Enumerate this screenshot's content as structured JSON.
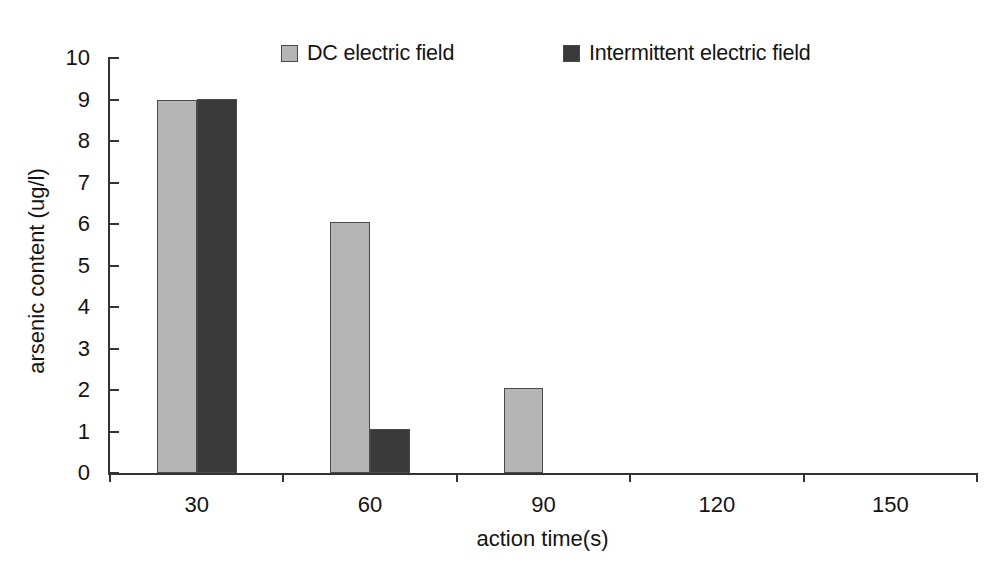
{
  "chart_data": {
    "type": "bar",
    "title": "",
    "xlabel": "action time(s)",
    "ylabel": "arsenic content (ug/l)",
    "categories": [
      "30",
      "60",
      "90",
      "120",
      "150"
    ],
    "series": [
      {
        "name": "DC electric field",
        "color": "#b5b5b5",
        "values": [
          9.0,
          6.05,
          2.05,
          0,
          0
        ]
      },
      {
        "name": "Intermittent electric field",
        "color": "#3a3a3a",
        "values": [
          9.02,
          1.05,
          0,
          0,
          0
        ]
      }
    ],
    "ylim": [
      0,
      10
    ],
    "yticks": [
      "0",
      "1",
      "2",
      "3",
      "4",
      "5",
      "6",
      "7",
      "8",
      "9",
      "10"
    ],
    "grid": false,
    "legend_position": "top"
  },
  "legend": {
    "entries": [
      {
        "label": "DC electric field",
        "swatch_color": "#b5b5b5"
      },
      {
        "label": "Intermittent electric field",
        "swatch_color": "#3a3a3a"
      }
    ]
  },
  "axes": {
    "y_title": "arsenic content (ug/l)",
    "x_title": "action time(s)",
    "y_tick_labels": [
      "10",
      "9",
      "8",
      "7",
      "6",
      "5",
      "4",
      "3",
      "2",
      "1",
      "0"
    ],
    "x_tick_labels": [
      "30",
      "60",
      "90",
      "120",
      "150"
    ]
  },
  "colors": {
    "series_light": "#b5b5b5",
    "series_dark": "#3a3a3a",
    "axis": "#333333",
    "text": "#141414",
    "bar_border": "#4a4a4a",
    "background": "#ffffff"
  }
}
